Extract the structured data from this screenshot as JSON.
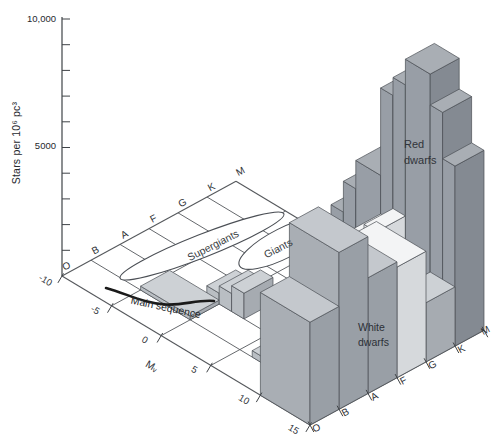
{
  "figure": {
    "width": 496,
    "height": 438,
    "background": "#ffffff"
  },
  "chart_data": {
    "type": "bar",
    "subtype": "3d-histogram-on-HR-plane",
    "title": "",
    "z_axis": {
      "label": "Stars per 10⁶ pc³",
      "max": 10000,
      "tick_step": 1000,
      "tick_labels": [
        "10,000",
        "5000"
      ],
      "tick_label_values": [
        10000,
        5000
      ]
    },
    "spectral_axis": {
      "letters": [
        "O",
        "B",
        "A",
        "F",
        "G",
        "K",
        "M"
      ]
    },
    "mv_axis": {
      "label": "Mᵥ",
      "ticks": [
        "-10",
        "-5",
        "0",
        "5",
        "10",
        "15"
      ],
      "tick_values": [
        -10,
        -5,
        0,
        5,
        10,
        15
      ]
    },
    "annotations": {
      "supergiants": "Supergiants",
      "giants": "Giants",
      "main_sequence": "Main sequence",
      "red_dwarfs_line1": "Red",
      "red_dwarfs_line2": "dwarfs",
      "white_dwarfs_line1": "White",
      "white_dwarfs_line2": "dwarfs"
    },
    "bars": [
      {
        "cell": "B-A",
        "s": 1,
        "mv": -5,
        "depth": 5,
        "value": 150,
        "shade": "light"
      },
      {
        "cell": "A-F",
        "s": 2,
        "mv": -1.25,
        "depth": 1.25,
        "value": 420,
        "shade": "light"
      },
      {
        "cell": "A-F",
        "s": 2,
        "mv": 0,
        "depth": 1.25,
        "value": 700,
        "shade": "light"
      },
      {
        "cell": "A-F",
        "s": 2,
        "mv": 1.25,
        "depth": 1.25,
        "value": 1000,
        "shade": "light"
      },
      {
        "cell": "F-G",
        "s": 3,
        "mv": 2.5,
        "depth": 1.25,
        "value": 500,
        "shade": "white"
      },
      {
        "cell": "F-G",
        "s": 3,
        "mv": 3.75,
        "depth": 1.25,
        "value": 900,
        "shade": "white"
      },
      {
        "cell": "F-G",
        "s": 3,
        "mv": 5,
        "depth": 1.25,
        "value": 1400,
        "shade": "white"
      },
      {
        "cell": "F-G",
        "s": 3,
        "mv": 6.25,
        "depth": 1.25,
        "value": 2200,
        "shade": "white"
      },
      {
        "cell": "F-G",
        "s": 3,
        "mv": 7.5,
        "depth": 2.5,
        "value": 2800,
        "shade": "white"
      },
      {
        "cell": "G-K",
        "s": 4,
        "mv": 3.75,
        "depth": 1.25,
        "value": 800,
        "shade": "light"
      },
      {
        "cell": "G-K",
        "s": 4,
        "mv": 5,
        "depth": 1.25,
        "value": 1600,
        "shade": "light"
      },
      {
        "cell": "G-K",
        "s": 4,
        "mv": 6.25,
        "depth": 1.25,
        "value": 2600,
        "shade": "white"
      },
      {
        "cell": "G-K",
        "s": 4,
        "mv": 7.5,
        "depth": 1.25,
        "value": 3400,
        "shade": "white"
      },
      {
        "cell": "G-K",
        "s": 4,
        "mv": 8.75,
        "depth": 1.25,
        "value": 3900,
        "shade": "white"
      },
      {
        "cell": "K-M",
        "s": 5,
        "mv": 2.5,
        "depth": 1.25,
        "value": 2600,
        "shade": "dark"
      },
      {
        "cell": "K-M",
        "s": 5,
        "mv": 3.75,
        "depth": 1.25,
        "value": 3800,
        "shade": "dark"
      },
      {
        "cell": "K-M",
        "s": 5,
        "mv": 5,
        "depth": 2.5,
        "value": 4900,
        "shade": "dark"
      },
      {
        "cell": "K-M",
        "s": 5,
        "mv": 7.5,
        "depth": 1.25,
        "value": 8300,
        "shade": "dark"
      },
      {
        "cell": "K-M",
        "s": 5,
        "mv": 8.75,
        "depth": 1.25,
        "value": 9000,
        "shade": "dark"
      },
      {
        "cell": "K-M",
        "s": 5,
        "mv": 10,
        "depth": 2.5,
        "value": 10000,
        "shade": "dark",
        "label": "red_dwarfs"
      },
      {
        "cell": "K-M",
        "s": 5,
        "mv": 12.5,
        "depth": 1.25,
        "value": 8800,
        "shade": "dark"
      },
      {
        "cell": "K-M",
        "s": 5,
        "mv": 13.75,
        "depth": 1.25,
        "value": 7000,
        "shade": "dark"
      },
      {
        "cell": "B-A",
        "s": 1,
        "mv": 6.25,
        "depth": 1.25,
        "value": 250,
        "shade": "light"
      },
      {
        "cell": "B-A",
        "s": 1,
        "mv": 7.5,
        "depth": 1.25,
        "value": 500,
        "shade": "light"
      },
      {
        "cell": "B-A",
        "s": 1,
        "mv": 8.75,
        "depth": 1.25,
        "value": 800,
        "shade": "light"
      },
      {
        "cell": "O-B",
        "s": 0,
        "mv": 10,
        "depth": 5,
        "value": 4000,
        "shade": "mid"
      },
      {
        "cell": "B-A",
        "s": 1,
        "mv": 10,
        "depth": 5,
        "value": 6100,
        "shade": "mid",
        "label": "white_dwarfs"
      },
      {
        "cell": "A-F",
        "s": 2,
        "mv": 10,
        "depth": 5,
        "value": 4500,
        "shade": "mid"
      },
      {
        "cell": "F-G",
        "s": 3,
        "mv": 10,
        "depth": 5,
        "value": 4300,
        "shade": "white"
      },
      {
        "cell": "G-K",
        "s": 4,
        "mv": 12.5,
        "depth": 2.5,
        "value": 2300,
        "shade": "light"
      }
    ],
    "shades": {
      "light": {
        "top": "#cdd1d5",
        "left": "#b9bec3",
        "front": "#a6abb1"
      },
      "mid": {
        "top": "#c4c8cd",
        "left": "#a9aeb4",
        "front": "#999fa6"
      },
      "white": {
        "top": "#f3f4f5",
        "left": "#e8eaec",
        "front": "#d6d9dc"
      },
      "dark": {
        "top": "#a9aeb4",
        "left": "#989ea6",
        "front": "#848a92"
      }
    },
    "line_color": "#55585c",
    "axis_color": "#3f4347",
    "bar_edge_color": "#4b4f55",
    "curve_color": "#1a1a1a",
    "text_color": "#2e3237"
  }
}
